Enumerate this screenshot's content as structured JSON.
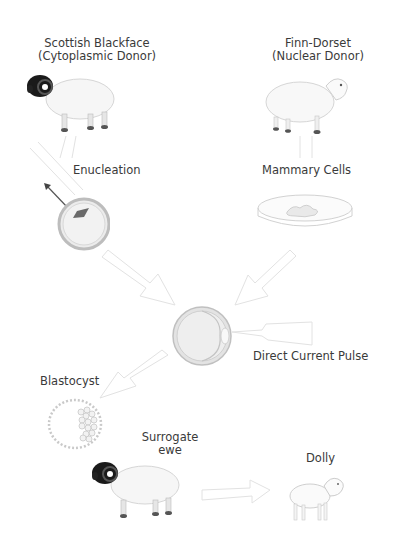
{
  "diagram": {
    "nodes": {
      "cytoplasmic_donor": {
        "line1": "Scottish Blackface",
        "line2": "(Cytoplasmic Donor)",
        "icon": "black-faced-sheep"
      },
      "nuclear_donor": {
        "line1": "Finn-Dorset",
        "line2": "(Nuclear Donor)",
        "icon": "white-faced-sheep"
      },
      "enucleation": {
        "label": "Enucleation",
        "icon": "egg-cell-with-pipette"
      },
      "mammary_cells": {
        "label": "Mammary Cells",
        "icon": "petri-dish"
      },
      "fused_cell": {
        "icon": "fused-egg-cell"
      },
      "pulse": {
        "label": "Direct Current Pulse"
      },
      "blastocyst": {
        "label": "Blastocyst",
        "icon": "blastocyst"
      },
      "surrogate": {
        "line1": "Surrogate",
        "line2": "ewe",
        "icon": "black-faced-sheep"
      },
      "dolly": {
        "label": "Dolly",
        "icon": "lamb"
      }
    },
    "colors": {
      "text": "#3a3a3a",
      "arrow": "#d8d8d8",
      "black_face": "#1a1a1a",
      "wool": "#f4f4f4",
      "cell_ring": "#bdbdbd"
    }
  }
}
